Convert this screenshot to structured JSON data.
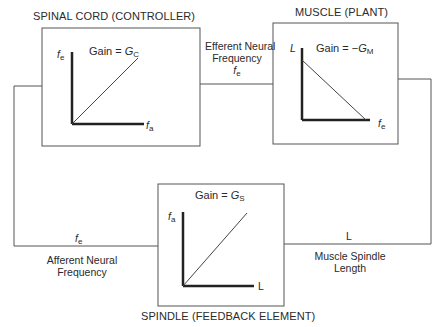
{
  "diagram": {
    "type": "feedback-control-loop",
    "blocks": {
      "controller": {
        "title": "SPINAL CORD (CONTROLLER)",
        "gain_prefix": "Gain = ",
        "gain_symbol": "G",
        "gain_subscript": "C",
        "y_axis": "f",
        "y_axis_sub": "e",
        "x_axis": "f",
        "x_axis_sub": "a",
        "curve": "increasing-line"
      },
      "plant": {
        "title": "MUSCLE (PLANT)",
        "gain_prefix": "Gain = −",
        "gain_symbol": "G",
        "gain_subscript": "M",
        "y_axis": "L",
        "x_axis": "f",
        "x_axis_sub": "e",
        "curve": "decreasing-line"
      },
      "feedback": {
        "title": "SPINDLE (FEEDBACK ELEMENT)",
        "gain_prefix": "Gain = ",
        "gain_symbol": "G",
        "gain_subscript": "S",
        "y_axis": "f",
        "y_axis_sub": "a",
        "x_axis": "L",
        "curve": "increasing-line"
      }
    },
    "signals": {
      "efferent": {
        "line1": "Efferent Neural",
        "line2": "Frequency",
        "symbol": "f",
        "symbol_sub": "e"
      },
      "spindle_length": {
        "symbol": "L",
        "line1": "Muscle Spindle",
        "line2": "Length"
      },
      "afferent": {
        "symbol": "f",
        "symbol_sub": "e",
        "line1": "Afferent Neural",
        "line2": "Frequency"
      }
    },
    "colors": {
      "line": "#555555",
      "axis": "#222222",
      "text": "#2a2a2a"
    }
  }
}
